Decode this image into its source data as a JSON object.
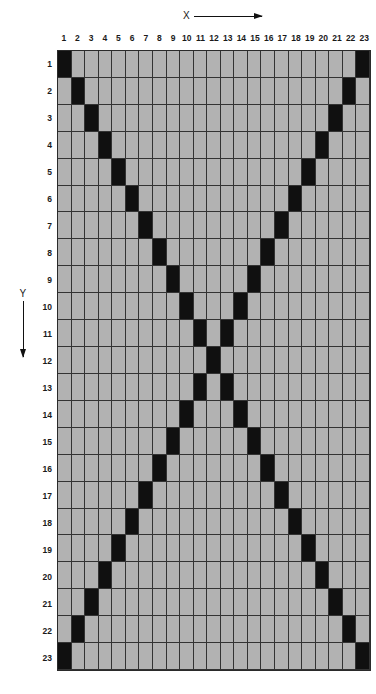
{
  "axes": {
    "x_label": "X",
    "y_label": "Y",
    "x_arrow_icon": "arrow-right-icon",
    "y_arrow_icon": "arrow-down-icon"
  },
  "colors": {
    "cell_off": "#b2b2b2",
    "cell_on": "#101010",
    "gridline": "#333333",
    "background": "#ffffff"
  },
  "column_labels": [
    "1",
    "2",
    "3",
    "4",
    "5",
    "6",
    "7",
    "8",
    "9",
    "10",
    "11",
    "12",
    "13",
    "14",
    "15",
    "16",
    "17",
    "18",
    "19",
    "20",
    "21",
    "22",
    "23"
  ],
  "row_labels": [
    "1",
    "2",
    "3",
    "4",
    "5",
    "6",
    "7",
    "8",
    "9",
    "10",
    "11",
    "12",
    "13",
    "14",
    "15",
    "16",
    "17",
    "18",
    "19",
    "20",
    "21",
    "22",
    "23"
  ],
  "chart_data": {
    "type": "heatmap",
    "title": "",
    "xlabel": "X",
    "ylabel": "Y",
    "grid": true,
    "legend": "none",
    "rows": 23,
    "cols": 23,
    "x": [
      1,
      2,
      3,
      4,
      5,
      6,
      7,
      8,
      9,
      10,
      11,
      12,
      13,
      14,
      15,
      16,
      17,
      18,
      19,
      20,
      21,
      22,
      23
    ],
    "y": [
      1,
      2,
      3,
      4,
      5,
      6,
      7,
      8,
      9,
      10,
      11,
      12,
      13,
      14,
      15,
      16,
      17,
      18,
      19,
      20,
      21,
      22,
      23
    ],
    "value_labels": {
      "0": "empty",
      "1": "filled"
    },
    "values": [
      [
        1,
        0,
        0,
        0,
        0,
        0,
        0,
        0,
        0,
        0,
        0,
        0,
        0,
        0,
        0,
        0,
        0,
        0,
        0,
        0,
        0,
        0,
        1
      ],
      [
        0,
        1,
        0,
        0,
        0,
        0,
        0,
        0,
        0,
        0,
        0,
        0,
        0,
        0,
        0,
        0,
        0,
        0,
        0,
        0,
        0,
        1,
        0
      ],
      [
        0,
        0,
        1,
        0,
        0,
        0,
        0,
        0,
        0,
        0,
        0,
        0,
        0,
        0,
        0,
        0,
        0,
        0,
        0,
        0,
        1,
        0,
        0
      ],
      [
        0,
        0,
        0,
        1,
        0,
        0,
        0,
        0,
        0,
        0,
        0,
        0,
        0,
        0,
        0,
        0,
        0,
        0,
        0,
        1,
        0,
        0,
        0
      ],
      [
        0,
        0,
        0,
        0,
        1,
        0,
        0,
        0,
        0,
        0,
        0,
        0,
        0,
        0,
        0,
        0,
        0,
        0,
        1,
        0,
        0,
        0,
        0
      ],
      [
        0,
        0,
        0,
        0,
        0,
        1,
        0,
        0,
        0,
        0,
        0,
        0,
        0,
        0,
        0,
        0,
        0,
        1,
        0,
        0,
        0,
        0,
        0
      ],
      [
        0,
        0,
        0,
        0,
        0,
        0,
        1,
        0,
        0,
        0,
        0,
        0,
        0,
        0,
        0,
        0,
        1,
        0,
        0,
        0,
        0,
        0,
        0
      ],
      [
        0,
        0,
        0,
        0,
        0,
        0,
        0,
        1,
        0,
        0,
        0,
        0,
        0,
        0,
        0,
        1,
        0,
        0,
        0,
        0,
        0,
        0,
        0
      ],
      [
        0,
        0,
        0,
        0,
        0,
        0,
        0,
        0,
        1,
        0,
        0,
        0,
        0,
        0,
        1,
        0,
        0,
        0,
        0,
        0,
        0,
        0,
        0
      ],
      [
        0,
        0,
        0,
        0,
        0,
        0,
        0,
        0,
        0,
        1,
        0,
        0,
        0,
        1,
        0,
        0,
        0,
        0,
        0,
        0,
        0,
        0,
        0
      ],
      [
        0,
        0,
        0,
        0,
        0,
        0,
        0,
        0,
        0,
        0,
        1,
        0,
        1,
        0,
        0,
        0,
        0,
        0,
        0,
        0,
        0,
        0,
        0
      ],
      [
        0,
        0,
        0,
        0,
        0,
        0,
        0,
        0,
        0,
        0,
        0,
        1,
        0,
        0,
        0,
        0,
        0,
        0,
        0,
        0,
        0,
        0,
        0
      ],
      [
        0,
        0,
        0,
        0,
        0,
        0,
        0,
        0,
        0,
        0,
        1,
        0,
        1,
        0,
        0,
        0,
        0,
        0,
        0,
        0,
        0,
        0,
        0
      ],
      [
        0,
        0,
        0,
        0,
        0,
        0,
        0,
        0,
        0,
        1,
        0,
        0,
        0,
        1,
        0,
        0,
        0,
        0,
        0,
        0,
        0,
        0,
        0
      ],
      [
        0,
        0,
        0,
        0,
        0,
        0,
        0,
        0,
        1,
        0,
        0,
        0,
        0,
        0,
        1,
        0,
        0,
        0,
        0,
        0,
        0,
        0,
        0
      ],
      [
        0,
        0,
        0,
        0,
        0,
        0,
        0,
        1,
        0,
        0,
        0,
        0,
        0,
        0,
        0,
        1,
        0,
        0,
        0,
        0,
        0,
        0,
        0
      ],
      [
        0,
        0,
        0,
        0,
        0,
        0,
        1,
        0,
        0,
        0,
        0,
        0,
        0,
        0,
        0,
        0,
        1,
        0,
        0,
        0,
        0,
        0,
        0
      ],
      [
        0,
        0,
        0,
        0,
        0,
        1,
        0,
        0,
        0,
        0,
        0,
        0,
        0,
        0,
        0,
        0,
        0,
        1,
        0,
        0,
        0,
        0,
        0
      ],
      [
        0,
        0,
        0,
        0,
        1,
        0,
        0,
        0,
        0,
        0,
        0,
        0,
        0,
        0,
        0,
        0,
        0,
        0,
        1,
        0,
        0,
        0,
        0
      ],
      [
        0,
        0,
        0,
        1,
        0,
        0,
        0,
        0,
        0,
        0,
        0,
        0,
        0,
        0,
        0,
        0,
        0,
        0,
        0,
        1,
        0,
        0,
        0
      ],
      [
        0,
        0,
        1,
        0,
        0,
        0,
        0,
        0,
        0,
        0,
        0,
        0,
        0,
        0,
        0,
        0,
        0,
        0,
        0,
        0,
        1,
        0,
        0
      ],
      [
        0,
        1,
        0,
        0,
        0,
        0,
        0,
        0,
        0,
        0,
        0,
        0,
        0,
        0,
        0,
        0,
        0,
        0,
        0,
        0,
        0,
        1,
        0
      ],
      [
        1,
        0,
        0,
        0,
        0,
        0,
        0,
        0,
        0,
        0,
        0,
        0,
        0,
        0,
        0,
        0,
        0,
        0,
        0,
        0,
        0,
        0,
        1
      ]
    ]
  }
}
